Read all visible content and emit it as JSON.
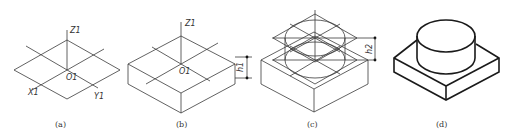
{
  "figure": {
    "panels": [
      {
        "id": "a",
        "caption": "(a)",
        "labels": {
          "z": "Z1",
          "origin": "O1",
          "x": "X1",
          "y": "Y1"
        }
      },
      {
        "id": "b",
        "caption": "(b)",
        "labels": {
          "z": "Z1",
          "origin": "O1",
          "dimension": "h1"
        }
      },
      {
        "id": "c",
        "caption": "(c)",
        "labels": {
          "dimension": "h2"
        }
      },
      {
        "id": "d",
        "caption": "(d)"
      }
    ],
    "colors": {
      "line": "#3a3a3a",
      "outline": "#1a1a1a",
      "background": "#ffffff"
    }
  }
}
